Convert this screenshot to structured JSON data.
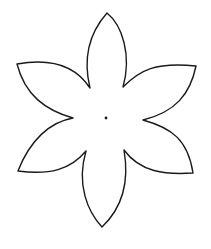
{
  "figure": {
    "description": "Six-petal flower outline template with center dot",
    "petal_count": 6,
    "stroke_color": "#1a1a1a",
    "fill_color": "#ffffff",
    "background": "#ffffff",
    "center": [
      106,
      118
    ],
    "petal_tips": [
      [
        107,
        13
      ],
      [
        196,
        66
      ],
      [
        193,
        173
      ],
      [
        102,
        227
      ],
      [
        18,
        171
      ],
      [
        17,
        64
      ]
    ],
    "notches": [
      [
        123,
        87
      ],
      [
        143,
        120
      ],
      [
        124,
        150
      ],
      [
        86,
        151
      ],
      [
        73,
        118
      ],
      [
        90,
        88
      ]
    ]
  }
}
